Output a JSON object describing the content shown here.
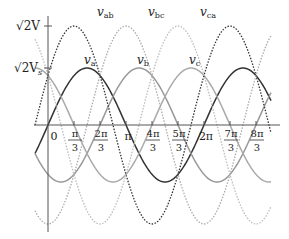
{
  "chart_data": {
    "type": "line",
    "title": "",
    "xlabel": "",
    "ylabel": "",
    "x_unit": "rad (omega t)",
    "xlim": [
      -0.5,
      8.75
    ],
    "ylim_relative": [
      -1.0,
      1.0
    ],
    "grid": false,
    "x_ticks": [
      {
        "pos": 0,
        "label": "0"
      },
      {
        "pos": 1,
        "num": "π",
        "den": "3"
      },
      {
        "pos": 2,
        "num": "2π",
        "den": "3"
      },
      {
        "pos": 3,
        "label": "π"
      },
      {
        "pos": 4,
        "num": "4π",
        "den": "3"
      },
      {
        "pos": 5,
        "num": "5π",
        "den": "3"
      },
      {
        "pos": 6,
        "label": "2π"
      },
      {
        "pos": 7,
        "num": "7π",
        "den": "3"
      },
      {
        "pos": 8,
        "num": "8π",
        "den": "3"
      }
    ],
    "y_ticks": [
      {
        "label": "√2V",
        "value": "line amplitude"
      },
      {
        "label": "√2V",
        "sub": "s",
        "value": "phase amplitude"
      }
    ],
    "series": [
      {
        "name": "v_a",
        "label": "v",
        "sub": "a",
        "amplitude": "√2Vs",
        "phase_deg": 0,
        "style": "solid",
        "color": "#333333"
      },
      {
        "name": "v_b",
        "label": "v",
        "sub": "b",
        "amplitude": "√2Vs",
        "phase_deg": -120,
        "style": "solid",
        "color": "#999999"
      },
      {
        "name": "v_c",
        "label": "v",
        "sub": "c",
        "amplitude": "√2Vs",
        "phase_deg": -240,
        "style": "solid",
        "color": "#aaaaaa"
      },
      {
        "name": "v_ab",
        "label": "v",
        "sub": "ab",
        "amplitude": "√2V",
        "phase_deg": 30,
        "style": "dotted",
        "color": "#333333"
      },
      {
        "name": "v_bc",
        "label": "v",
        "sub": "bc",
        "amplitude": "√2V",
        "phase_deg": -90,
        "style": "dotted",
        "color": "#aaaaaa"
      },
      {
        "name": "v_ca",
        "label": "v",
        "sub": "ca",
        "amplitude": "√2V",
        "phase_deg": -210,
        "style": "dotted",
        "color": "#bbbbbb"
      }
    ]
  },
  "labels": {
    "y_top": "√2V",
    "y_mid": "√2V",
    "y_mid_sub": "s"
  }
}
